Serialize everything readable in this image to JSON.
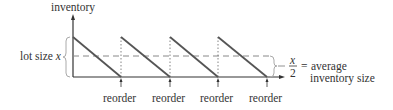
{
  "diagram": {
    "y_axis_label": "inventory",
    "lot_size_label": "lot size",
    "lot_size_var": "x",
    "fraction_numerator": "x",
    "fraction_denominator": "2",
    "equals": "=",
    "average_line1": "average",
    "average_line2": "inventory size",
    "reorder_labels": [
      "reorder",
      "reorder",
      "reorder",
      "reorder"
    ],
    "colors": {
      "sawtooth": "#555555",
      "axis": "#333333",
      "dashed": "#888888",
      "brace": "#aaaaaa",
      "text": "#333333"
    }
  }
}
